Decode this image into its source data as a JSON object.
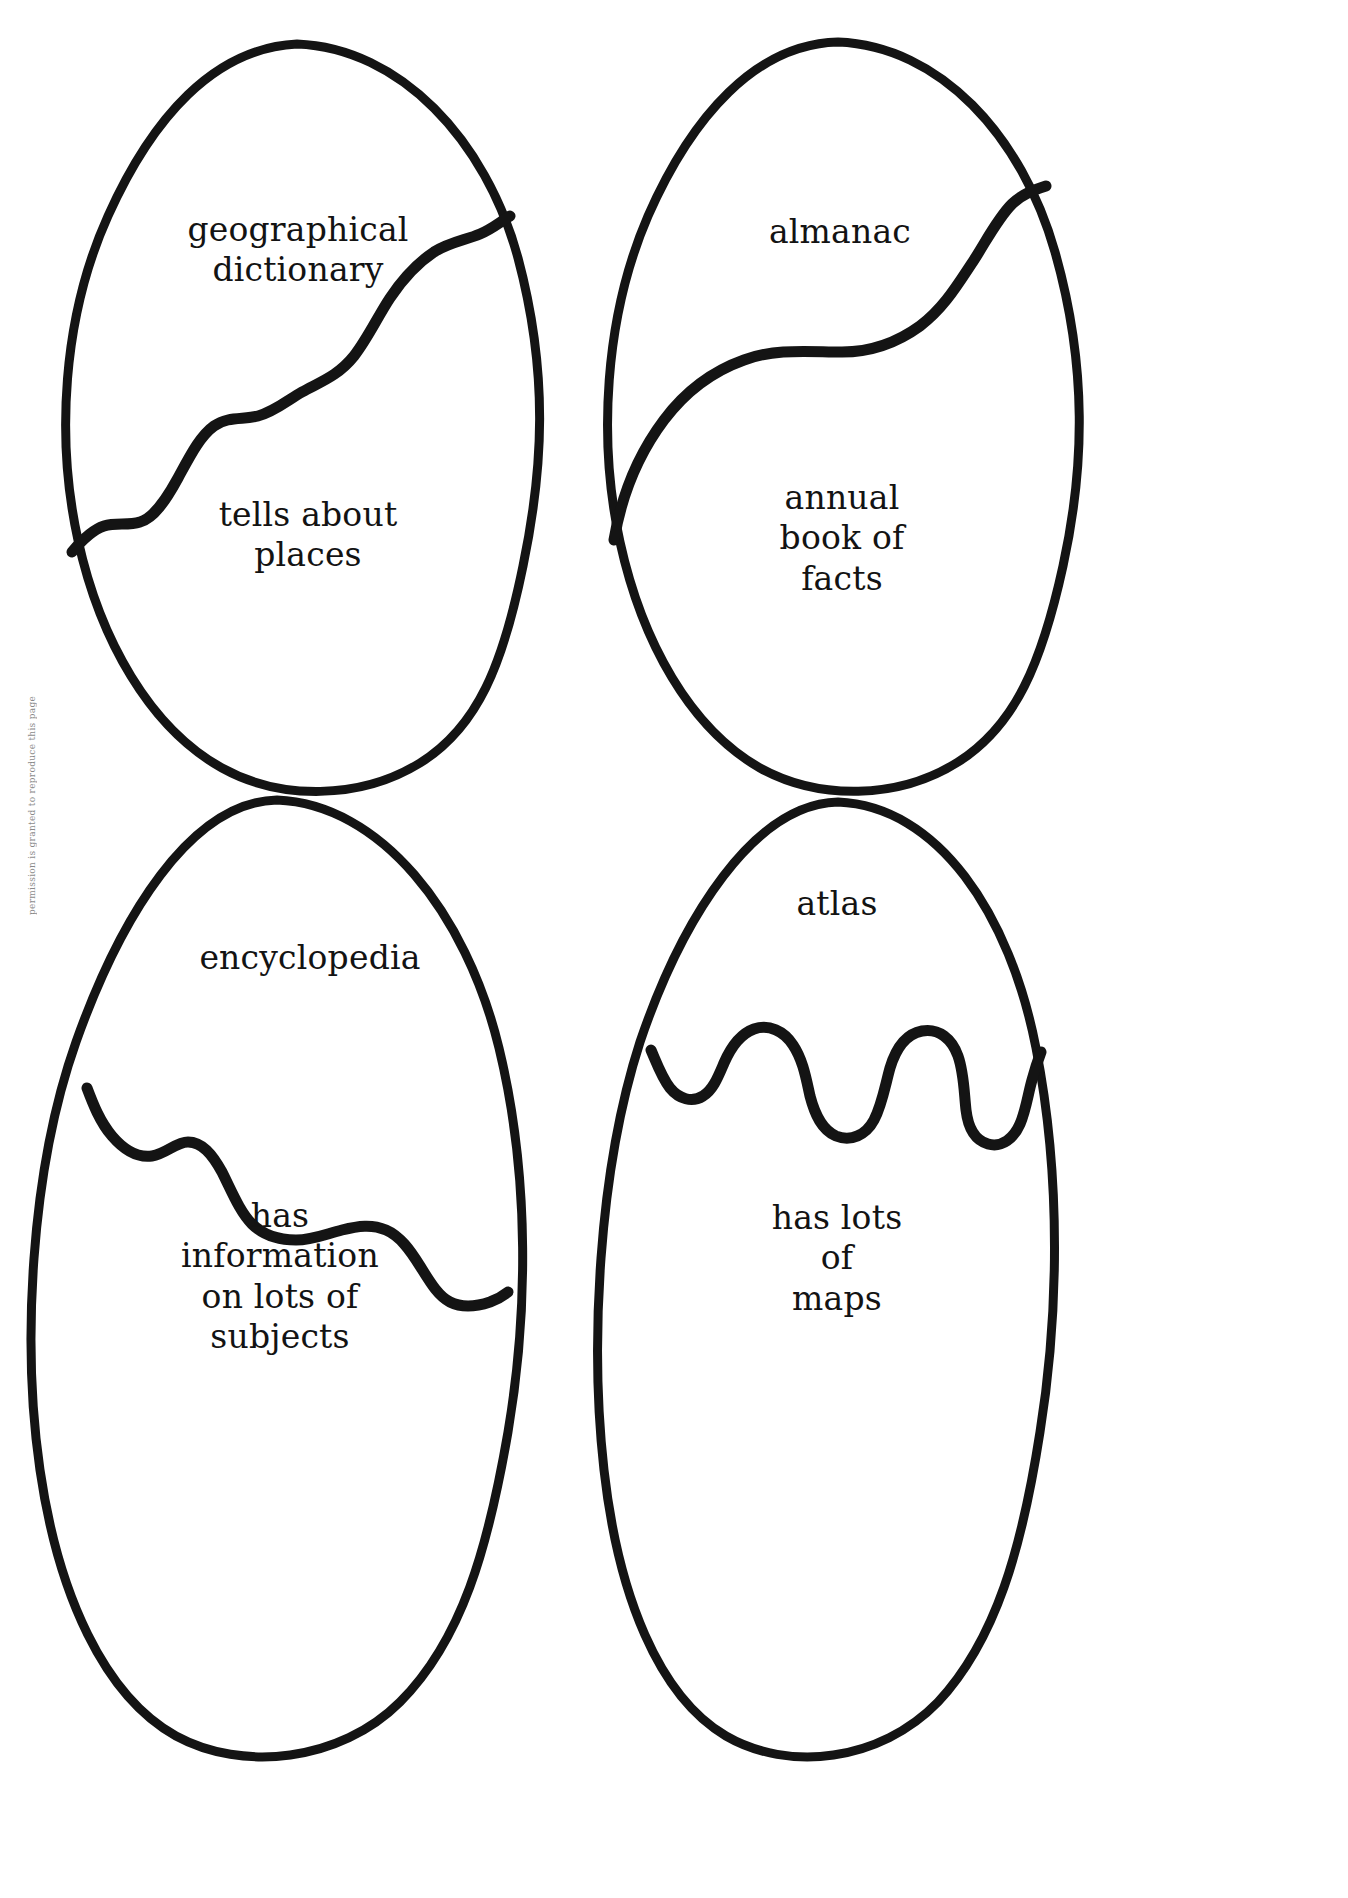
{
  "page": {
    "background_color": "#ffffff",
    "ink_color": "#141414"
  },
  "margin_note": {
    "text": "permission is granted to reproduce this page"
  },
  "eggs": [
    {
      "id": "geographical-dictionary",
      "top_label": "geographical\ndictionary",
      "bottom_label": "tells about\nplaces",
      "crack_style": "gentle-wave"
    },
    {
      "id": "almanac",
      "top_label": "almanac",
      "bottom_label": "annual\nbook of\nfacts",
      "crack_style": "long-diagonal-wave"
    },
    {
      "id": "encyclopedia",
      "top_label": "encyclopedia",
      "bottom_label": "has\ninformation\non lots of\nsubjects",
      "crack_style": "rolling-wave"
    },
    {
      "id": "atlas",
      "top_label": "atlas",
      "bottom_label": "has lots\nof\nmaps",
      "crack_style": "deep-zigzag-drip"
    }
  ]
}
